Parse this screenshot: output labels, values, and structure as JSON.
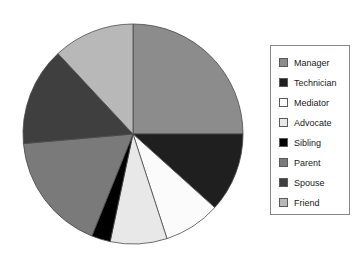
{
  "chart_data": {
    "type": "pie",
    "title": "",
    "subtitle": "",
    "xlabel": "",
    "ylabel": "",
    "grid": false,
    "legend_position": "right",
    "start_angle_deg": 90,
    "direction": "clockwise",
    "center": {
      "x": 133,
      "y": 134
    },
    "radius": 110,
    "categories": [
      "Manager",
      "Technician",
      "Mediator",
      "Advocate",
      "Sibling",
      "Parent",
      "Spouse",
      "Friend"
    ],
    "values": [
      25.0,
      11.7,
      8.3,
      8.3,
      2.8,
      17.5,
      14.4,
      12.0
    ],
    "angles_deg": [
      90,
      42,
      30,
      30,
      10,
      63,
      52,
      43
    ],
    "colors": [
      "#8c8c8c",
      "#1f1f1f",
      "#fbfbfb",
      "#e8e8e8",
      "#000000",
      "#7a7a7a",
      "#3f3f3f",
      "#b8b8b8"
    ],
    "slice_border_color": "#4a4a4a",
    "series": [
      {
        "name": "Share",
        "values": [
          25.0,
          11.7,
          8.3,
          8.3,
          2.8,
          17.5,
          14.4,
          12.0
        ]
      }
    ]
  },
  "legend": {
    "items": [
      {
        "label": "Manager",
        "color": "#8c8c8c"
      },
      {
        "label": "Technician",
        "color": "#1f1f1f"
      },
      {
        "label": "Mediator",
        "color": "#fbfbfb"
      },
      {
        "label": "Advocate",
        "color": "#e8e8e8"
      },
      {
        "label": "Sibling",
        "color": "#000000"
      },
      {
        "label": "Parent",
        "color": "#7a7a7a"
      },
      {
        "label": "Spouse",
        "color": "#3f3f3f"
      },
      {
        "label": "Friend",
        "color": "#b8b8b8"
      }
    ]
  }
}
